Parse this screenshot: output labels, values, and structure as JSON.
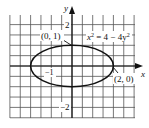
{
  "chart_data": {
    "type": "line",
    "title": "",
    "equation": "x² = 4 − 4y²",
    "curve": "ellipse",
    "center": [
      0,
      0
    ],
    "semi_axis_x": 2,
    "semi_axis_y": 1,
    "xlabel": "x",
    "ylabel": "y",
    "xlim": [
      -3,
      3
    ],
    "ylim": [
      -2.5,
      2.5
    ],
    "grid": true,
    "grid_step": 0.5,
    "x_tick_labels": [
      {
        "value": -1,
        "label": "−1"
      }
    ],
    "y_tick_labels": [
      {
        "value": 2,
        "label": "2"
      },
      {
        "value": -2,
        "label": "−2"
      }
    ],
    "annotations": [
      {
        "point": [
          0,
          1
        ],
        "label": "(0, 1)"
      },
      {
        "point": [
          2,
          0
        ],
        "label": "(2, 0)"
      },
      {
        "text": "x² = 4 − 4y²",
        "near": [
          1,
          1.2
        ]
      }
    ],
    "colors": {
      "curve": "#111111",
      "grid": "#444444",
      "background": "#ffffff"
    }
  },
  "labels": {
    "x_axis": "x",
    "y_axis": "y",
    "tick_neg1_x": "−1",
    "tick_2_y": "2",
    "tick_neg2_y": "−2",
    "point_top": "(0, 1)",
    "point_right": "(2, 0)",
    "eq_lhs": "x",
    "eq_exp1": "2",
    "eq_mid": " = 4 − 4y",
    "eq_exp2": "2"
  }
}
